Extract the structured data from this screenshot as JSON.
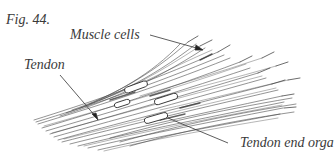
{
  "figure": {
    "number_label": "Fig. 44.",
    "labels": {
      "muscle_cells": "Muscle cells",
      "tendon": "Tendon",
      "tendon_end_organ": "Tendon end orga"
    },
    "colors": {
      "ink": "#3a3a3a",
      "background": "#ffffff",
      "capsule": "#ffffff"
    }
  }
}
